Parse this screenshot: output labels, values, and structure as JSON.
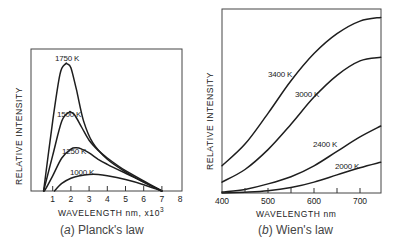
{
  "chart_data": [
    {
      "type": "line",
      "panel": "a",
      "caption": "(a)  Planck's law",
      "caption_letter": "a",
      "caption_text": "Planck's law",
      "xlabel": "WAVELENGTH nm, x10",
      "xlabel_exp": "3",
      "ylabel": "RELATIVE   INTENSITY",
      "xlim": [
        0,
        8
      ],
      "ylim": [
        0,
        1
      ],
      "xticks": [
        1,
        2,
        3,
        4,
        5,
        6,
        7,
        8
      ],
      "grid": false,
      "series": [
        {
          "name": "1750K",
          "label": "1750 K",
          "x": [
            0.5,
            1.0,
            1.4,
            1.7,
            1.8,
            2.0,
            2.3,
            2.7,
            3.2,
            4.0,
            5.0,
            6.0,
            7.0
          ],
          "y": [
            0.0,
            0.55,
            0.92,
            1.0,
            1.0,
            0.97,
            0.8,
            0.55,
            0.38,
            0.25,
            0.15,
            0.07,
            0.0
          ]
        },
        {
          "name": "1500K",
          "label": "1500 K",
          "x": [
            0.5,
            1.0,
            1.5,
            1.9,
            2.0,
            2.2,
            2.6,
            3.0,
            3.5,
            4.0,
            5.0,
            6.0,
            7.0
          ],
          "y": [
            0.0,
            0.28,
            0.55,
            0.62,
            0.62,
            0.6,
            0.5,
            0.4,
            0.32,
            0.26,
            0.16,
            0.08,
            0.0
          ]
        },
        {
          "name": "1250K",
          "label": "1250 K",
          "x": [
            0.55,
            1.0,
            1.5,
            2.0,
            2.3,
            2.6,
            3.0,
            3.5,
            4.0,
            5.0,
            6.0,
            7.0
          ],
          "y": [
            0.0,
            0.12,
            0.26,
            0.33,
            0.34,
            0.33,
            0.3,
            0.25,
            0.21,
            0.14,
            0.07,
            0.0
          ]
        },
        {
          "name": "1000K",
          "label": "1000 K",
          "x": [
            1.1,
            1.5,
            2.0,
            2.5,
            3.0,
            3.5,
            4.0,
            5.0,
            6.0,
            7.0
          ],
          "y": [
            0.0,
            0.06,
            0.1,
            0.12,
            0.13,
            0.13,
            0.12,
            0.09,
            0.05,
            0.0
          ]
        }
      ]
    },
    {
      "type": "line",
      "panel": "b",
      "caption": "(b)  Wien's law",
      "caption_letter": "b",
      "caption_text": "Wien's law",
      "xlabel": "WAVELENGTH  nm",
      "ylabel": "RELATIVE   INTENSITY",
      "xlim": [
        400,
        745
      ],
      "ylim": [
        0,
        1
      ],
      "xticks": [
        400,
        500,
        600,
        700
      ],
      "minor_xticks": [
        450,
        550,
        650
      ],
      "grid": false,
      "series": [
        {
          "name": "3400K",
          "label": "3400 K",
          "x": [
            400,
            450,
            500,
            550,
            600,
            650,
            700,
            745
          ],
          "y": [
            0.15,
            0.27,
            0.44,
            0.62,
            0.77,
            0.88,
            0.95,
            0.97
          ]
        },
        {
          "name": "3000K",
          "label": "3000 K",
          "x": [
            400,
            450,
            500,
            550,
            600,
            650,
            700,
            745
          ],
          "y": [
            0.06,
            0.13,
            0.24,
            0.38,
            0.53,
            0.65,
            0.73,
            0.75
          ]
        },
        {
          "name": "2400K",
          "label": "2400 K",
          "x": [
            400,
            450,
            500,
            550,
            600,
            650,
            700,
            745
          ],
          "y": [
            0.005,
            0.02,
            0.05,
            0.09,
            0.15,
            0.23,
            0.31,
            0.37
          ]
        },
        {
          "name": "2000K",
          "label": "2000 K",
          "x": [
            400,
            450,
            500,
            550,
            600,
            650,
            700,
            745
          ],
          "y": [
            0.0,
            0.004,
            0.012,
            0.03,
            0.06,
            0.1,
            0.14,
            0.17
          ]
        }
      ]
    }
  ]
}
